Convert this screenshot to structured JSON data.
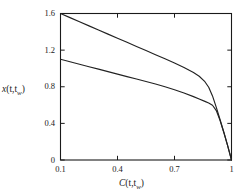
{
  "figure": {
    "background_color": "#ffffff",
    "line_color": "#222222",
    "axis_color": "#1a1a1a"
  },
  "axes": {
    "x_title_main": "C",
    "x_title_args": "(t,t",
    "x_title_sub": "w",
    "x_title_close": ")",
    "y_title_main": "x",
    "y_title_args": "(t,t",
    "y_title_sub": "w",
    "y_title_close": ")"
  },
  "xticks": [
    {
      "value": 0.1,
      "label": "0.1"
    },
    {
      "value": 0.4,
      "label": "0.4"
    },
    {
      "value": 0.7,
      "label": "0.7"
    },
    {
      "value": 1.0,
      "label": "1"
    }
  ],
  "yticks": [
    {
      "value": 0.0,
      "label": "0"
    },
    {
      "value": 0.4,
      "label": "0.4"
    },
    {
      "value": 0.8,
      "label": "0.8"
    },
    {
      "value": 1.2,
      "label": "1.2"
    },
    {
      "value": 1.6,
      "label": "1.6"
    }
  ],
  "chart_data": {
    "type": "line",
    "title": "",
    "xlabel": "C(t,t_w)",
    "ylabel": "x(t,t_w)",
    "xlim": [
      0.1,
      1.0
    ],
    "ylim": [
      0.0,
      1.6
    ],
    "grid": false,
    "legend": "none",
    "series": [
      {
        "name": "upper-curve",
        "x": [
          0.1,
          0.15,
          0.2,
          0.25,
          0.3,
          0.35,
          0.4,
          0.45,
          0.5,
          0.55,
          0.6,
          0.65,
          0.7,
          0.75,
          0.8,
          0.83,
          0.86,
          0.88,
          0.9,
          0.92,
          0.94,
          0.96,
          0.98,
          1.0
        ],
        "y": [
          1.6,
          1.555,
          1.51,
          1.465,
          1.42,
          1.375,
          1.33,
          1.285,
          1.24,
          1.195,
          1.15,
          1.105,
          1.06,
          1.01,
          0.955,
          0.915,
          0.855,
          0.795,
          0.7,
          0.575,
          0.44,
          0.3,
          0.155,
          0.0
        ]
      },
      {
        "name": "lower-curve",
        "x": [
          0.1,
          0.15,
          0.2,
          0.25,
          0.3,
          0.35,
          0.4,
          0.45,
          0.5,
          0.55,
          0.6,
          0.65,
          0.7,
          0.75,
          0.8,
          0.83,
          0.86,
          0.88,
          0.9,
          0.92,
          0.94,
          0.96,
          0.98,
          1.0
        ],
        "y": [
          1.1,
          1.073,
          1.046,
          1.019,
          0.992,
          0.965,
          0.938,
          0.911,
          0.884,
          0.857,
          0.83,
          0.8,
          0.768,
          0.732,
          0.692,
          0.667,
          0.64,
          0.622,
          0.598,
          0.54,
          0.43,
          0.298,
          0.155,
          0.0
        ]
      }
    ],
    "annotations": []
  }
}
